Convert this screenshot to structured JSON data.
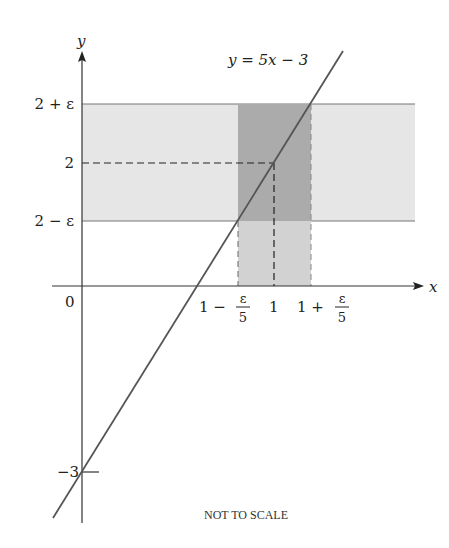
{
  "diagram": {
    "equation_label": "y = 5x − 3",
    "axis_labels": {
      "x": "x",
      "y": "y"
    },
    "y_ticks": [
      {
        "label": "2 + ε",
        "value": "2+eps"
      },
      {
        "label": "2",
        "value": "2"
      },
      {
        "label": "2 − ε",
        "value": "2-eps"
      },
      {
        "label": "−3",
        "value": "-3"
      }
    ],
    "x_ticks": [
      {
        "label": "1 − ε/5",
        "main": "1 −",
        "num": "ε",
        "den": "5"
      },
      {
        "label": "1",
        "main": "1"
      },
      {
        "label": "1 + ε/5",
        "main": "1 +",
        "num": "ε",
        "den": "5"
      }
    ],
    "origin_label": "0",
    "caption": "NOT TO SCALE",
    "colors": {
      "horizontal_band": "#e4e4e4",
      "vertical_band": "#a9a9a9",
      "vertical_band_lower": "#cfcfcf",
      "line": "#555555",
      "axis": "#333333"
    }
  }
}
